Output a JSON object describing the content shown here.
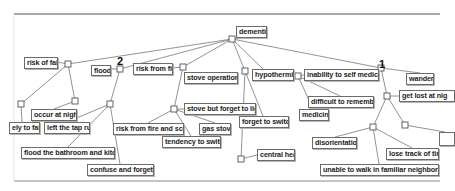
{
  "diagram": {
    "root": "dementia",
    "markers": [
      {
        "label": "2",
        "x": 117,
        "y": 56
      },
      {
        "label": "1",
        "x": 379,
        "y": 59
      }
    ],
    "nodes": [
      {
        "id": "dementia",
        "label": "dementia",
        "x": 236,
        "y": 26,
        "w": 31,
        "h": 12
      },
      {
        "id": "risk_of_fall",
        "label": "risk of fall",
        "x": 24,
        "y": 57,
        "w": 34,
        "h": 12
      },
      {
        "id": "flood",
        "label": "flood",
        "x": 91,
        "y": 65,
        "w": 20,
        "h": 11
      },
      {
        "id": "risk_from_fire",
        "label": "risk from fire",
        "x": 133,
        "y": 63,
        "w": 40,
        "h": 12
      },
      {
        "id": "stove_operation",
        "label": "stove operation",
        "x": 184,
        "y": 72,
        "w": 54,
        "h": 12
      },
      {
        "id": "hypothermia",
        "label": "hypothermia",
        "x": 252,
        "y": 69,
        "w": 42,
        "h": 12
      },
      {
        "id": "inability_self_medicate",
        "label": "inability to self medicate",
        "x": 304,
        "y": 69,
        "w": 75,
        "h": 12
      },
      {
        "id": "wander",
        "label": "wander",
        "x": 406,
        "y": 73,
        "w": 28,
        "h": 12
      },
      {
        "id": "get_lost",
        "label": "get lost at nig",
        "x": 399,
        "y": 90,
        "w": 56,
        "h": 12
      },
      {
        "id": "occur_at_night",
        "label": "occur at night",
        "x": 31,
        "y": 109,
        "w": 46,
        "h": 12
      },
      {
        "id": "likely_to_fail",
        "label": "ely to fail",
        "x": 9,
        "y": 122,
        "w": 31,
        "h": 12
      },
      {
        "id": "left_tap_run",
        "label": "left the tap run",
        "x": 44,
        "y": 122,
        "w": 46,
        "h": 12
      },
      {
        "id": "flood_bathroom",
        "label": "flood the bathroom and kitchen",
        "x": 21,
        "y": 147,
        "w": 94,
        "h": 12
      },
      {
        "id": "confuse_forgetful",
        "label": "confuse and forgetful",
        "x": 87,
        "y": 164,
        "w": 67,
        "h": 12
      },
      {
        "id": "stove_forget_light",
        "label": "stove but forget to light",
        "x": 184,
        "y": 103,
        "w": 72,
        "h": 12
      },
      {
        "id": "risk_fire_scald",
        "label": "risk from fire and scald",
        "x": 113,
        "y": 123,
        "w": 71,
        "h": 12
      },
      {
        "id": "gas_stove",
        "label": "gas stove",
        "x": 199,
        "y": 123,
        "w": 32,
        "h": 12
      },
      {
        "id": "tendency_switch",
        "label": "tendency to switch",
        "x": 162,
        "y": 136,
        "w": 59,
        "h": 12
      },
      {
        "id": "forget_switch",
        "label": "forget to switch",
        "x": 239,
        "y": 116,
        "w": 50,
        "h": 12
      },
      {
        "id": "central_heat",
        "label": "central heat",
        "x": 257,
        "y": 149,
        "w": 38,
        "h": 12
      },
      {
        "id": "difficult_remember",
        "label": "difficult to remember",
        "x": 308,
        "y": 96,
        "w": 66,
        "h": 12
      },
      {
        "id": "medicine",
        "label": "medicine",
        "x": 299,
        "y": 109,
        "w": 30,
        "h": 12
      },
      {
        "id": "disorientation",
        "label": "disorientation",
        "x": 312,
        "y": 137,
        "w": 45,
        "h": 12
      },
      {
        "id": "partial_box",
        "label": "",
        "x": 439,
        "y": 132,
        "w": 16,
        "h": 14
      },
      {
        "id": "lose_track_time",
        "label": "lose track of time",
        "x": 386,
        "y": 148,
        "w": 53,
        "h": 12
      },
      {
        "id": "unable_walk",
        "label": "unable to walk in familiar neighborhood",
        "x": 320,
        "y": 164,
        "w": 119,
        "h": 12
      }
    ],
    "junctions": [
      {
        "x": 232,
        "y": 39
      },
      {
        "x": 68,
        "y": 64
      },
      {
        "x": 120,
        "y": 69
      },
      {
        "x": 183,
        "y": 67
      },
      {
        "x": 245,
        "y": 71
      },
      {
        "x": 298,
        "y": 76
      },
      {
        "x": 381,
        "y": 68
      },
      {
        "x": 387,
        "y": 96
      },
      {
        "x": 75,
        "y": 101
      },
      {
        "x": 21,
        "y": 104
      },
      {
        "x": 110,
        "y": 104
      },
      {
        "x": 174,
        "y": 109
      },
      {
        "x": 241,
        "y": 159
      },
      {
        "x": 373,
        "y": 127
      },
      {
        "x": 405,
        "y": 125
      }
    ],
    "edges": [
      [
        232,
        39,
        251,
        38
      ],
      [
        232,
        39,
        68,
        64
      ],
      [
        232,
        39,
        120,
        69
      ],
      [
        232,
        39,
        183,
        67
      ],
      [
        232,
        39,
        245,
        71
      ],
      [
        232,
        39,
        263,
        69
      ],
      [
        232,
        39,
        381,
        68
      ],
      [
        381,
        68,
        420,
        73
      ],
      [
        381,
        68,
        387,
        96
      ],
      [
        387,
        96,
        399,
        96
      ],
      [
        387,
        96,
        373,
        127
      ],
      [
        387,
        96,
        405,
        125
      ],
      [
        405,
        125,
        445,
        132
      ],
      [
        373,
        127,
        335,
        137
      ],
      [
        373,
        127,
        412,
        148
      ],
      [
        373,
        127,
        379,
        164
      ],
      [
        68,
        64,
        57,
        62
      ],
      [
        68,
        64,
        75,
        101
      ],
      [
        68,
        64,
        21,
        104
      ],
      [
        75,
        101,
        54,
        109
      ],
      [
        21,
        104,
        22,
        122
      ],
      [
        120,
        69,
        110,
        69
      ],
      [
        120,
        69,
        110,
        104
      ],
      [
        110,
        104,
        67,
        122
      ],
      [
        110,
        104,
        68,
        147
      ],
      [
        110,
        104,
        120,
        164
      ],
      [
        183,
        67,
        172,
        68
      ],
      [
        183,
        67,
        174,
        109
      ],
      [
        174,
        109,
        184,
        109
      ],
      [
        174,
        109,
        148,
        123
      ],
      [
        174,
        109,
        215,
        123
      ],
      [
        174,
        109,
        191,
        136
      ],
      [
        245,
        71,
        241,
        159
      ],
      [
        245,
        71,
        263,
        116
      ],
      [
        241,
        159,
        257,
        155
      ],
      [
        294,
        75,
        298,
        76
      ],
      [
        298,
        76,
        304,
        75
      ],
      [
        298,
        76,
        340,
        96
      ],
      [
        298,
        76,
        313,
        109
      ]
    ]
  }
}
